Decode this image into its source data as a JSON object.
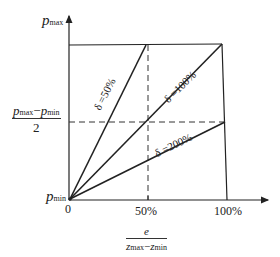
{
  "diagram": {
    "type": "proportional-band line diagram",
    "y_axis": {
      "top_label_var": "p",
      "top_label_sub": "max",
      "mid_label_num_a": "p",
      "mid_label_num_a_sub": "max",
      "mid_label_minus": "−",
      "mid_label_num_b": "p",
      "mid_label_num_b_sub": "min",
      "mid_label_den": "2",
      "bottom_label_var": "p",
      "bottom_label_sub": "min"
    },
    "x_axis": {
      "origin": "0",
      "ticks": [
        "50%",
        "100%"
      ],
      "label_num": "e",
      "label_den_a": "z",
      "label_den_a_sub": "max",
      "label_den_minus": "−",
      "label_den_b": "z",
      "label_den_b_sub": "min"
    },
    "lines": [
      {
        "name": "delta-50",
        "label": "δ =50%"
      },
      {
        "name": "delta-100",
        "label": "δ =100%"
      },
      {
        "name": "delta-200",
        "label": "δ =200%"
      }
    ],
    "colors": {
      "line": "#222222",
      "background": "#ffffff"
    }
  }
}
